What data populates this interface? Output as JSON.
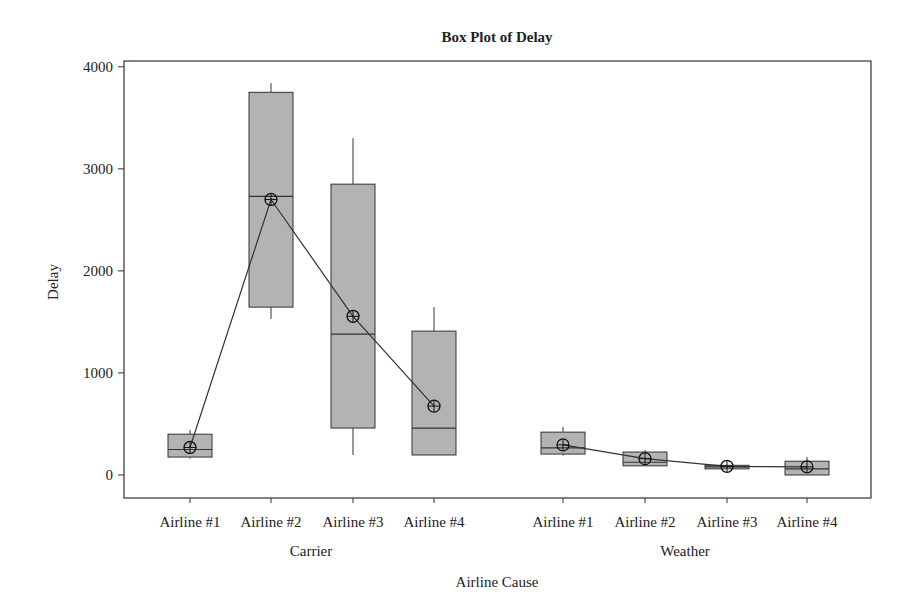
{
  "chart_data": {
    "type": "box",
    "title": "Box Plot of Delay",
    "xlabel": "Airline Cause",
    "ylabel": "Delay",
    "ylim": [
      -220,
      4060
    ],
    "yticks": [
      0,
      1000,
      2000,
      3000,
      4000
    ],
    "grid": false,
    "legend": null,
    "groups": [
      "Carrier",
      "Weather"
    ],
    "categories": [
      "Airline #1",
      "Airline #2",
      "Airline #3",
      "Airline #4"
    ],
    "connect_means": true,
    "series": [
      {
        "group": "Carrier",
        "category": "Airline #1",
        "min": 160,
        "q1": 176,
        "median": 250,
        "q3": 400,
        "max": 440,
        "mean": 270
      },
      {
        "group": "Carrier",
        "category": "Airline #2",
        "min": 1530,
        "q1": 1645,
        "median": 2730,
        "q3": 3750,
        "max": 3840,
        "mean": 2700
      },
      {
        "group": "Carrier",
        "category": "Airline #3",
        "min": 195,
        "q1": 460,
        "median": 1380,
        "q3": 2850,
        "max": 3300,
        "mean": 1555
      },
      {
        "group": "Carrier",
        "category": "Airline #4",
        "min": 196,
        "q1": 196,
        "median": 460,
        "q3": 1410,
        "max": 1645,
        "mean": 675
      },
      {
        "group": "Weather",
        "category": "Airline #1",
        "min": 190,
        "q1": 205,
        "median": 265,
        "q3": 420,
        "max": 470,
        "mean": 295
      },
      {
        "group": "Weather",
        "category": "Airline #2",
        "min": 90,
        "q1": 90,
        "median": 125,
        "q3": 225,
        "max": 245,
        "mean": 160
      },
      {
        "group": "Weather",
        "category": "Airline #3",
        "min": 60,
        "q1": 60,
        "median": 80,
        "q3": 95,
        "max": 95,
        "mean": 85
      },
      {
        "group": "Weather",
        "category": "Airline #4",
        "min": 0,
        "q1": 0,
        "median": 60,
        "q3": 135,
        "max": 175,
        "mean": 80
      }
    ],
    "style": {
      "box_fill": "#b3b3b3",
      "line_color": "#333333"
    }
  }
}
